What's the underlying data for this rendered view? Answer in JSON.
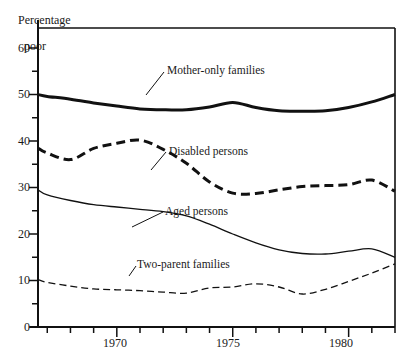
{
  "chart": {
    "axis_title_line1": "Percentage",
    "axis_title_line2": "poor",
    "y_ticks_major": [
      "0",
      "10",
      "20",
      "30",
      "40",
      "50",
      "60"
    ],
    "x_ticks_major": [
      "1970",
      "1975",
      "1980"
    ]
  },
  "labels": {
    "mother_only": "Mother-only families",
    "disabled": "Disabled persons",
    "aged": "Aged persons",
    "two_parent": "Two-parent families"
  },
  "chart_data": {
    "type": "line",
    "title": "",
    "xlabel": "",
    "ylabel": "Percentage poor",
    "xlim": [
      1966.6,
      1982.0
    ],
    "ylim": [
      0,
      60
    ],
    "y_major_ticks": [
      0,
      10,
      20,
      30,
      40,
      50,
      60
    ],
    "y_minor_ticks": [
      5,
      15,
      25,
      35,
      45,
      55
    ],
    "x_major_ticks": [
      1970,
      1975,
      1980
    ],
    "x_minor_ticks": [
      1967,
      1968,
      1969,
      1971,
      1972,
      1973,
      1974,
      1976,
      1977,
      1978,
      1979,
      1981,
      1982
    ],
    "grid": false,
    "legend": "inline annotations with leader lines",
    "x": [
      1966.6,
      1967,
      1968,
      1969,
      1970,
      1971,
      1972,
      1973,
      1974,
      1975,
      1976,
      1977,
      1978,
      1979,
      1980,
      1981,
      1982
    ],
    "series": [
      {
        "name": "Mother-only families",
        "style": "solid-thick",
        "values": [
          50.0,
          49.6,
          49.0,
          48.2,
          47.5,
          46.9,
          46.7,
          46.7,
          47.3,
          48.3,
          47.2,
          46.5,
          46.4,
          46.5,
          47.2,
          48.4,
          50.0
        ]
      },
      {
        "name": "Disabled persons",
        "style": "dashed-thick",
        "values": [
          38.5,
          37.4,
          36.0,
          38.4,
          39.5,
          40.2,
          38.2,
          35.2,
          31.2,
          28.8,
          28.7,
          29.5,
          30.2,
          30.4,
          30.6,
          31.6,
          29.2
        ]
      },
      {
        "name": "Aged persons",
        "style": "solid-thin",
        "values": [
          29.5,
          28.4,
          27.2,
          26.3,
          25.8,
          25.3,
          24.8,
          23.9,
          22.1,
          20.0,
          18.1,
          16.6,
          15.8,
          15.7,
          16.3,
          16.8,
          15.0
        ]
      },
      {
        "name": "Two-parent families",
        "style": "dashed-thin",
        "values": [
          10.2,
          9.6,
          8.8,
          8.2,
          8.0,
          7.8,
          7.5,
          7.3,
          8.4,
          8.6,
          9.3,
          8.6,
          7.1,
          8.1,
          9.8,
          11.6,
          13.6
        ]
      }
    ]
  }
}
